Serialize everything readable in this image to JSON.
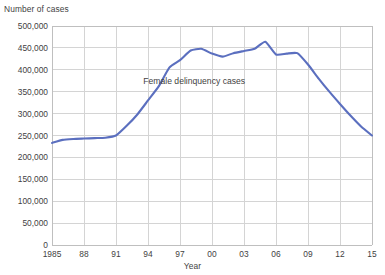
{
  "chart_data": {
    "type": "line",
    "title": "",
    "ylabel": "Number of cases",
    "xlabel": "Year",
    "ylim": [
      0,
      500000
    ],
    "ytick_labels": [
      "500,000",
      "450,000",
      "400,000",
      "350,000",
      "300,000",
      "250,000",
      "200,000",
      "150,000",
      "100,000",
      "50,000",
      "0"
    ],
    "ytick_values": [
      500000,
      450000,
      400000,
      350000,
      300000,
      250000,
      200000,
      150000,
      100000,
      50000,
      0
    ],
    "xtick_labels": [
      "1985",
      "88",
      "91",
      "94",
      "97",
      "00",
      "03",
      "06",
      "09",
      "12",
      "15"
    ],
    "xtick_values": [
      1985,
      1988,
      1991,
      1994,
      1997,
      2000,
      2003,
      2006,
      2009,
      2012,
      2015
    ],
    "xlim": [
      1985,
      2015
    ],
    "grid": true,
    "legend_position": "inline-annotation",
    "annotations": [
      {
        "text": "Female delinquency cases",
        "x": 1999,
        "y": 375000
      }
    ],
    "series": [
      {
        "name": "Female delinquency cases",
        "color": "#5b6fbf",
        "x": [
          1985,
          1986,
          1987,
          1988,
          1989,
          1990,
          1991,
          1992,
          1993,
          1994,
          1995,
          1996,
          1997,
          1998,
          1999,
          2000,
          2001,
          2002,
          2003,
          2004,
          2005,
          2006,
          2007,
          2008,
          2009,
          2010,
          2011,
          2012,
          2013,
          2014,
          2015
        ],
        "values": [
          233000,
          240000,
          242000,
          243000,
          244000,
          245000,
          250000,
          272000,
          298000,
          330000,
          362000,
          405000,
          422000,
          444000,
          448000,
          437000,
          430000,
          438000,
          443000,
          448000,
          464000,
          435000,
          437000,
          438000,
          412000,
          380000,
          350000,
          322000,
          295000,
          270000,
          250000
        ]
      }
    ]
  },
  "colors": {
    "line": "#5b6fbf",
    "grid": "#d4d4d4",
    "axis": "#bfbfbf",
    "text": "#3f3f3f",
    "background": "#ffffff"
  }
}
